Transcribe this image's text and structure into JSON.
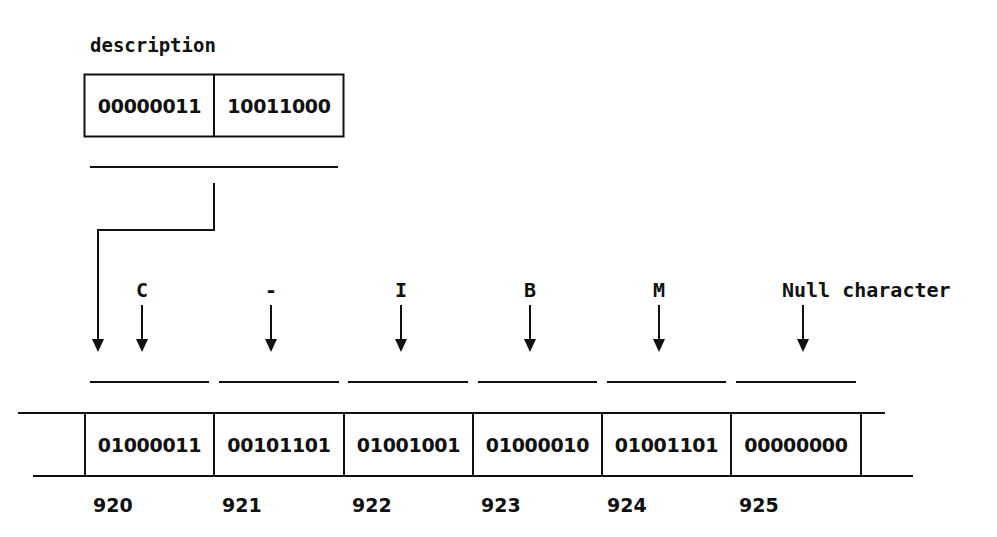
{
  "variable": {
    "name": "description",
    "bytes": [
      "00000011",
      "10011000"
    ]
  },
  "memory": {
    "cells": [
      {
        "char_label": "C",
        "value": "01000011",
        "address": "920"
      },
      {
        "char_label": "-",
        "value": "00101101",
        "address": "921"
      },
      {
        "char_label": "I",
        "value": "01001001",
        "address": "922"
      },
      {
        "char_label": "B",
        "value": "01000010",
        "address": "923"
      },
      {
        "char_label": "M",
        "value": "01001101",
        "address": "924"
      },
      {
        "char_label": "Null character",
        "value": "00000000",
        "address": "925"
      }
    ]
  },
  "colors": {
    "line": "#111111",
    "background": "#ffffff"
  }
}
